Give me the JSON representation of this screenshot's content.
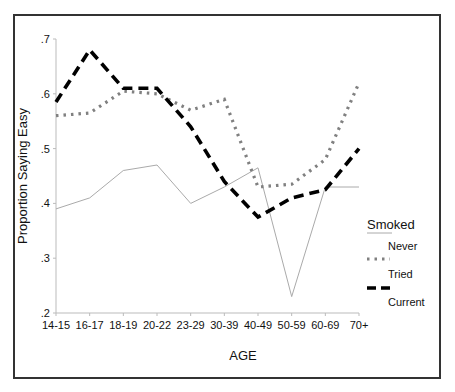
{
  "chart_data": {
    "type": "line",
    "title": "",
    "xlabel": "AGE",
    "ylabel": "Proportion Saying Easy",
    "ylim": [
      0.2,
      0.7
    ],
    "yticks": [
      ".2",
      ".3",
      ".4",
      ".5",
      ".6",
      ".7"
    ],
    "grid": false,
    "legend_position": "right",
    "legend_title": "Smoked",
    "categories": [
      "14-15",
      "16-17",
      "18-19",
      "20-22",
      "23-29",
      "30-39",
      "40-49",
      "50-59",
      "60-69",
      "70+"
    ],
    "series": [
      {
        "name": "Never",
        "style": "thin-solid",
        "color": "#aaaaaa",
        "values": [
          0.39,
          0.41,
          0.46,
          0.47,
          0.4,
          0.43,
          0.465,
          0.23,
          0.43,
          0.43
        ]
      },
      {
        "name": "Tried",
        "style": "dotted",
        "color": "#808080",
        "values": [
          0.56,
          0.565,
          0.605,
          0.6,
          0.57,
          0.59,
          0.43,
          0.435,
          0.48,
          0.62
        ]
      },
      {
        "name": "Current",
        "style": "dashed",
        "color": "#000000",
        "values": [
          0.585,
          0.68,
          0.61,
          0.61,
          0.54,
          0.44,
          0.375,
          0.41,
          0.425,
          0.5
        ]
      }
    ]
  }
}
